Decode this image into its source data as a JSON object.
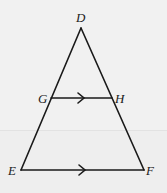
{
  "diagram": {
    "type": "triangle-with-parallel-segment",
    "points": {
      "D": {
        "label": "D",
        "x": 81,
        "y": 28
      },
      "G": {
        "label": "G",
        "x": 51,
        "y": 98
      },
      "H": {
        "label": "H",
        "x": 112,
        "y": 98
      },
      "E": {
        "label": "E",
        "x": 21,
        "y": 170
      },
      "F": {
        "label": "F",
        "x": 144,
        "y": 170
      }
    },
    "segments": [
      "DE",
      "DF",
      "GH",
      "EF"
    ],
    "parallel_marks": [
      "GH",
      "EF"
    ],
    "colors": {
      "stroke": "#1a1a1a",
      "background": "#f1f1f1"
    }
  }
}
